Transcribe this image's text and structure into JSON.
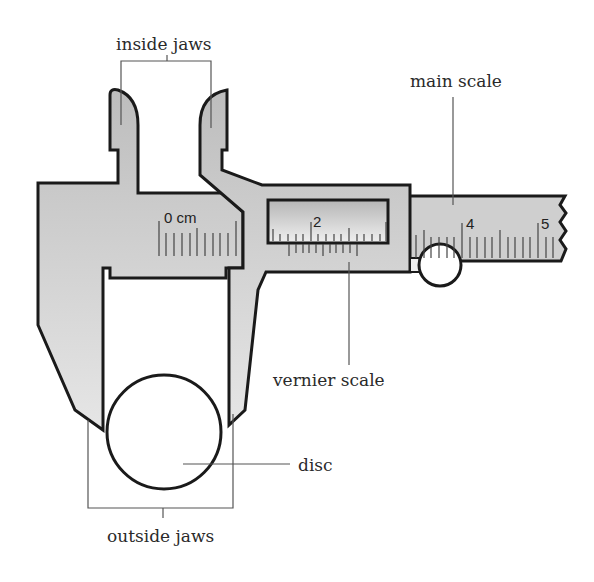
{
  "diagram": {
    "labels": {
      "inside_jaws": "inside jaws",
      "main_scale": "main scale",
      "vernier_scale": "vernier scale",
      "disc": "disc",
      "outside_jaws": "outside jaws"
    },
    "main_scale_numbers": {
      "zero": "0 cm",
      "two": "2",
      "four": "4",
      "five": "5"
    },
    "colors": {
      "body_fill": "#c8c8c8",
      "outline": "#1a1a1a",
      "leader_line": "#555555",
      "background": "#ffffff"
    }
  }
}
